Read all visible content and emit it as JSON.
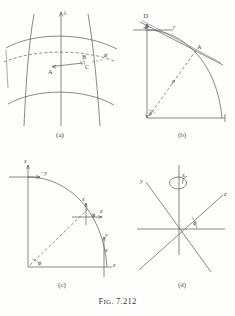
{
  "figure": {
    "caption_prefix": "F",
    "caption_smallcaps": "IG",
    "caption_rest": ". 7.212",
    "caption_full": "Fig. 7.212",
    "ink_color": "#58585a",
    "background_color": "#fdfdfc"
  },
  "panels": {
    "a": {
      "sublabel": "(a)",
      "labels": {
        "lambda": "λ",
        "phi": "ϕ",
        "point_a": "A",
        "point_b": "B",
        "point_c": "C"
      }
    },
    "b": {
      "sublabel": "(b)",
      "labels": {
        "point_d": "D",
        "point_a": "A",
        "r": "r",
        "rho": "ρ",
        "phi_top": "ϕ",
        "phi_bottom": "ϕ"
      }
    },
    "c": {
      "sublabel": "(c)",
      "labels": {
        "x_axis": "x",
        "z_axis": "z",
        "minus_y": "−y",
        "y_right": "y",
        "z_prime": "z",
        "phi_top_mid": "ϕ",
        "phi_origin": "ϕ",
        "x_mid": "x",
        "x_lower": "x"
      }
    },
    "d": {
      "sublabel": "(d)",
      "labels": {
        "x_axis": "x",
        "y_axis": "y",
        "z_axis": "z",
        "phi": "ϕ"
      }
    }
  }
}
